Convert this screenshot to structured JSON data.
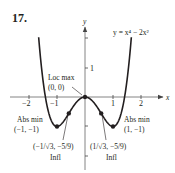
{
  "problem_number": "17.",
  "equation_label": "y = x⁴ − 2x²",
  "axes": {
    "x_label": "x",
    "y_label": "y",
    "x_ticks": [
      {
        "value": -2,
        "label": "−2"
      },
      {
        "value": -1,
        "label": "−1"
      },
      {
        "value": 1,
        "label": "1"
      },
      {
        "value": 2,
        "label": "2"
      }
    ],
    "y_ticks": [
      {
        "value": 2,
        "label": ""
      },
      {
        "value": 1,
        "label": "1"
      },
      {
        "value": -1,
        "label": ""
      },
      {
        "value": -2,
        "label": ""
      }
    ]
  },
  "annotations": {
    "loc_max": {
      "title": "Loc max",
      "coords": "(0, 0)"
    },
    "abs_min_left": {
      "title": "Abs min",
      "coords": "(−1, −1)"
    },
    "abs_min_right": {
      "title": "Abs min",
      "coords": "(1, −1)"
    },
    "infl_left": {
      "coords": "(−1/√3, −5/9)",
      "title": "Infl"
    },
    "infl_right": {
      "coords": "(1/√3, −5/9)",
      "title": "Infl"
    }
  },
  "colors": {
    "curve": "#231f20",
    "axis": "#777777",
    "background": "#ffffff"
  },
  "chart_data": {
    "type": "line",
    "function": "x^4 - 2x^2",
    "xlabel": "x",
    "ylabel": "y",
    "xlim": [
      -2.7,
      2.8
    ],
    "ylim": [
      -2.5,
      2.4
    ],
    "x_ticks": [
      -2,
      -1,
      1,
      2
    ],
    "y_ticks": [
      -2,
      -1,
      1,
      2
    ],
    "grid": false,
    "series": [
      {
        "name": "y = x^4 - 2x^2",
        "x": [
          -1.65,
          -1.5,
          -1.414,
          -1.25,
          -1.0,
          -0.75,
          -0.577,
          -0.5,
          -0.25,
          0,
          0.25,
          0.5,
          0.577,
          0.75,
          1.0,
          1.25,
          1.414,
          1.5,
          1.65
        ],
        "y": [
          1.97,
          0.56,
          0.0,
          -0.68,
          -1.0,
          -0.81,
          -0.556,
          -0.44,
          -0.12,
          0,
          -0.12,
          -0.44,
          -0.556,
          -0.81,
          -1.0,
          -0.68,
          0.0,
          0.56,
          1.97
        ]
      }
    ],
    "points": [
      {
        "label": "Loc max",
        "x": 0,
        "y": 0
      },
      {
        "label": "Abs min",
        "x": -1,
        "y": -1
      },
      {
        "label": "Abs min",
        "x": 1,
        "y": -1
      },
      {
        "label": "Infl",
        "x": -0.577,
        "y": -0.556
      },
      {
        "label": "Infl",
        "x": 0.577,
        "y": -0.556
      }
    ]
  }
}
